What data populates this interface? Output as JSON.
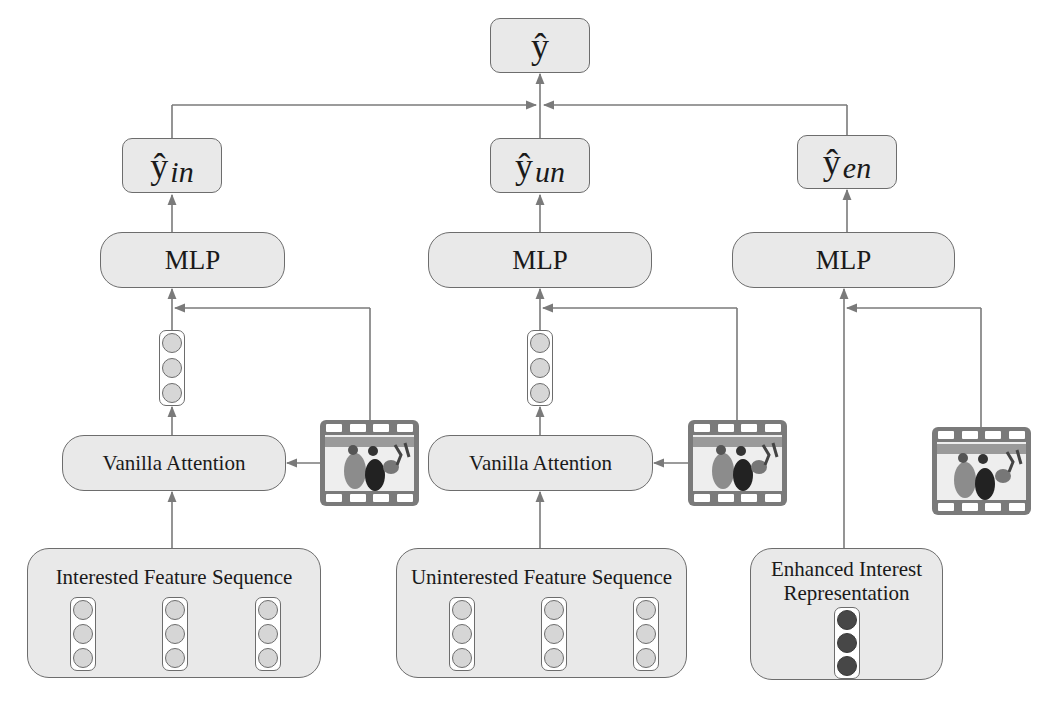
{
  "diagram": {
    "output": {
      "symbol": "ŷ"
    },
    "branches": [
      {
        "id": "interested",
        "prediction": {
          "symbol": "ŷ",
          "subscript": "in"
        },
        "mlp_label": "MLP",
        "attention_label": "Vanilla Attention",
        "sequence_label": "Interested Feature Sequence",
        "sequence_vectors": 3,
        "has_attention": true
      },
      {
        "id": "uninterested",
        "prediction": {
          "symbol": "ŷ",
          "subscript": "un"
        },
        "mlp_label": "MLP",
        "attention_label": "Vanilla Attention",
        "sequence_label": "Uninterested Feature Sequence",
        "sequence_vectors": 3,
        "has_attention": true
      },
      {
        "id": "enhanced",
        "prediction": {
          "symbol": "ŷ",
          "subscript": "en"
        },
        "mlp_label": "MLP",
        "sequence_label_line1": "Enhanced Interest",
        "sequence_label_line2": "Representation",
        "sequence_vectors": 1,
        "has_attention": false
      }
    ],
    "icons": {
      "target_item": "film-strip-icon",
      "pooled_vector": "embedding-vector-icon"
    },
    "colors": {
      "box_fill": "#e9e9e9",
      "box_border": "#6d6d6d",
      "line": "#7a7a7a",
      "dot_light": "#d6d6d6",
      "dot_dark": "#474747",
      "film": "#7a7a7a"
    }
  }
}
